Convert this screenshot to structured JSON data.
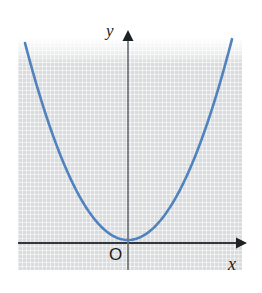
{
  "figure": {
    "name": "parabola-graph",
    "background_color": "#ffffff",
    "panel_color": "#d9dbdd"
  },
  "labels": {
    "y_axis": "y",
    "x_axis": "x",
    "origin": "O"
  },
  "chart_data": {
    "type": "line",
    "title": "",
    "subtitle": "",
    "xlabel": "x",
    "ylabel": "y",
    "origin_label": "O",
    "grid": true,
    "legend": null,
    "axis_color": "#33363a",
    "y_axis_color": "#6e7276",
    "curve_color": "#5182bd",
    "curve_width_px": 2.6,
    "xlim": [
      -5.2,
      5.7
    ],
    "ylim": [
      -0.6,
      10.5
    ],
    "ticks": {
      "x": [],
      "y": []
    },
    "annotations": [
      {
        "text": "y",
        "x_px": 112,
        "y_px": 30,
        "style": "italic-serif"
      },
      {
        "text": "x",
        "x_px": 232,
        "y_px": 264,
        "style": "italic-serif"
      },
      {
        "text": "O",
        "x_px": 116,
        "y_px": 255,
        "style": "upright-sans"
      }
    ],
    "axes_pixels": {
      "origin_px": [
        128,
        243
      ],
      "y_axis_top_px": [
        128,
        33
      ],
      "y_axis_bottom_px": [
        128,
        270
      ],
      "x_axis_left_px": [
        18,
        243
      ],
      "x_axis_right_px": [
        246,
        243
      ],
      "arrowheads": [
        "y-up",
        "x-right"
      ]
    },
    "series": [
      {
        "name": "y = x^2",
        "equation": "y = a*x^2",
        "vertex": [
          0,
          0
        ],
        "vertex_px": [
          128,
          240
        ],
        "opens": "up",
        "symmetric_about": "y-axis",
        "endpoints_px": [
          [
            25,
            43
          ],
          [
            232,
            43
          ]
        ],
        "x": [
          -5.2,
          -4.68,
          -4.16,
          -3.64,
          -3.12,
          -2.6,
          -2.08,
          -1.56,
          -1.04,
          -0.52,
          0,
          0.52,
          1.04,
          1.56,
          2.08,
          2.6,
          3.12,
          3.64,
          4.16,
          4.68,
          5.2
        ],
        "values": [
          10.4,
          8.42,
          6.65,
          5.09,
          3.74,
          2.6,
          1.66,
          0.94,
          0.42,
          0.1,
          0,
          0.1,
          0.42,
          0.94,
          1.66,
          2.6,
          3.74,
          5.09,
          6.65,
          8.42,
          10.4
        ]
      }
    ]
  }
}
